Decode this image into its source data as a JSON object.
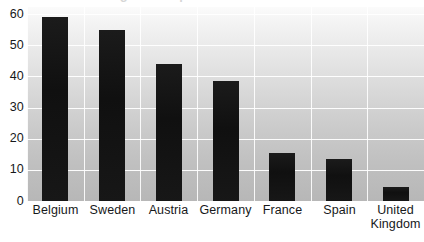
{
  "chart_data": {
    "type": "bar",
    "title": "",
    "xlabel": "",
    "ylabel": "",
    "categories": [
      "Belgium",
      "Sweden",
      "Austria",
      "Germany",
      "France",
      "Spain",
      "United Kingdom"
    ],
    "values": [
      59,
      55,
      44,
      38.5,
      15.5,
      13.5,
      4.5
    ],
    "ylim": [
      0,
      60
    ],
    "ytick_labels": [
      "60",
      "50",
      "40",
      "30",
      "20",
      "10",
      "0"
    ],
    "ytick_values": [
      60,
      50,
      40,
      30,
      20,
      10,
      0
    ],
    "grid": {
      "horizontal": true,
      "vertical": true,
      "color": "#ffffff"
    },
    "legend": {
      "visible": false,
      "position": "none",
      "entries": []
    },
    "bar_color": "#151515",
    "plot_background": {
      "type": "vertical-gradient",
      "top_color": "#fbfbfb",
      "bottom_color": "#b7b7b7"
    },
    "annotations": []
  },
  "axes": {
    "y": {
      "ticks": [
        {
          "label": "60",
          "value": 60
        },
        {
          "label": "50",
          "value": 50
        },
        {
          "label": "40",
          "value": 40
        },
        {
          "label": "30",
          "value": 30
        },
        {
          "label": "20",
          "value": 20
        },
        {
          "label": "10",
          "value": 10
        },
        {
          "label": "0",
          "value": 0
        }
      ]
    },
    "x": {
      "categories": [
        {
          "line1": "Belgium",
          "line2": ""
        },
        {
          "line1": "Sweden",
          "line2": ""
        },
        {
          "line1": "Austria",
          "line2": ""
        },
        {
          "line1": "Germany",
          "line2": ""
        },
        {
          "line1": "France",
          "line2": ""
        },
        {
          "line1": "Spain",
          "line2": ""
        },
        {
          "line1": "United",
          "line2": "Kingdom"
        }
      ]
    }
  },
  "title_remnant": {
    "text": "Percentage of respondents"
  }
}
